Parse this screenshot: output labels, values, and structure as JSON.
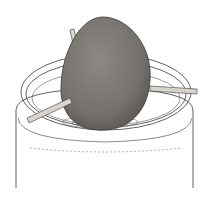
{
  "illustration": {
    "subject": "avocado pit suspended by toothpicks over jar of water",
    "colors": {
      "background": "#ffffff",
      "outline": "#3a3a3a",
      "pit_fill": "#7a7772",
      "pit_shade": "#5e5b57",
      "toothpick": "#d8d4cc"
    }
  }
}
